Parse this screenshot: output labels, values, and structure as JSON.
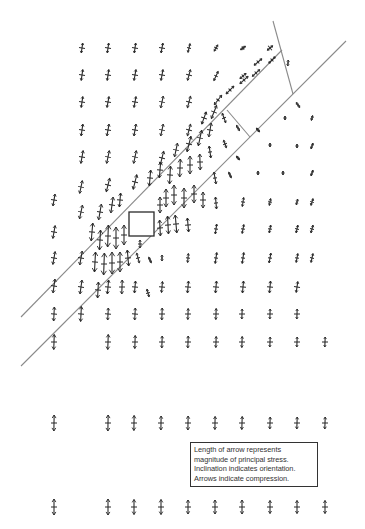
{
  "figure": {
    "type": "principal stress trajectory field",
    "background": "#ffffff",
    "ink_color": "#2a2a2a",
    "line_color": "#8a8a8a"
  },
  "legend": {
    "lines": [
      "Length of arrow represents",
      "magnitude of principal stress.",
      "Inclination indicates orientation.",
      "Arrows indicate compression."
    ]
  },
  "structure": {
    "fault_lines": [
      {
        "name": "upper-fault-line",
        "x1": 21,
        "y1": 317,
        "x2": 282,
        "y2": 50
      },
      {
        "name": "lower-fault-line",
        "x1": 21,
        "y1": 366,
        "x2": 346,
        "y2": 41
      }
    ],
    "end_lines": [
      {
        "name": "top-end-line",
        "x1": 273,
        "y1": 21,
        "x2": 293,
        "y2": 94
      },
      {
        "name": "inner-end-line",
        "x1": 227,
        "y1": 110,
        "x2": 250,
        "y2": 137
      }
    ],
    "square": {
      "x": 129,
      "y": 212,
      "w": 25,
      "h": 24
    }
  },
  "arrows": [
    {
      "x": 82,
      "y": 48,
      "len": 10,
      "ang": 8,
      "cross": 3
    },
    {
      "x": 108,
      "y": 48,
      "len": 10,
      "ang": 8,
      "cross": 3
    },
    {
      "x": 135,
      "y": 48,
      "len": 10,
      "ang": 8,
      "cross": 3
    },
    {
      "x": 162,
      "y": 48,
      "len": 10,
      "ang": 10,
      "cross": 3
    },
    {
      "x": 189,
      "y": 48,
      "len": 9,
      "ang": 14,
      "cross": 2
    },
    {
      "x": 216,
      "y": 48,
      "len": 7,
      "ang": 30,
      "cross": 2
    },
    {
      "x": 243,
      "y": 48,
      "len": 6,
      "ang": 55,
      "cross": 2
    },
    {
      "x": 270,
      "y": 48,
      "len": 7,
      "ang": 50,
      "cross": 3
    },
    {
      "x": 82,
      "y": 75,
      "len": 11,
      "ang": 8,
      "cross": 3
    },
    {
      "x": 108,
      "y": 75,
      "len": 11,
      "ang": 8,
      "cross": 3
    },
    {
      "x": 135,
      "y": 75,
      "len": 11,
      "ang": 10,
      "cross": 3
    },
    {
      "x": 162,
      "y": 75,
      "len": 11,
      "ang": 10,
      "cross": 3
    },
    {
      "x": 189,
      "y": 75,
      "len": 11,
      "ang": 15,
      "cross": 3
    },
    {
      "x": 216,
      "y": 76,
      "len": 10,
      "ang": 25,
      "cross": 2
    },
    {
      "x": 243,
      "y": 76,
      "len": 8,
      "ang": 50,
      "cross": 2
    },
    {
      "x": 258,
      "y": 62,
      "len": 10,
      "ang": 50,
      "cross": 2
    },
    {
      "x": 272,
      "y": 60,
      "len": 9,
      "ang": 45,
      "cross": 2
    },
    {
      "x": 288,
      "y": 63,
      "len": 6,
      "ang": 5,
      "cross": 1
    },
    {
      "x": 82,
      "y": 102,
      "len": 11,
      "ang": 8,
      "cross": 3
    },
    {
      "x": 108,
      "y": 102,
      "len": 11,
      "ang": 10,
      "cross": 3
    },
    {
      "x": 135,
      "y": 102,
      "len": 11,
      "ang": 10,
      "cross": 3
    },
    {
      "x": 162,
      "y": 102,
      "len": 12,
      "ang": 12,
      "cross": 3
    },
    {
      "x": 189,
      "y": 102,
      "len": 12,
      "ang": 15,
      "cross": 3
    },
    {
      "x": 230,
      "y": 90,
      "len": 11,
      "ang": 45,
      "cross": 2
    },
    {
      "x": 244,
      "y": 80,
      "len": 11,
      "ang": 48,
      "cross": 2
    },
    {
      "x": 256,
      "y": 73,
      "len": 10,
      "ang": 48,
      "cross": 2
    },
    {
      "x": 218,
      "y": 100,
      "len": 12,
      "ang": 38,
      "cross": 2
    },
    {
      "x": 298,
      "y": 105,
      "len": 6,
      "ang": -35,
      "cross": 1
    },
    {
      "x": 82,
      "y": 130,
      "len": 12,
      "ang": 8,
      "cross": 3
    },
    {
      "x": 108,
      "y": 130,
      "len": 12,
      "ang": 10,
      "cross": 3
    },
    {
      "x": 135,
      "y": 130,
      "len": 12,
      "ang": 10,
      "cross": 3
    },
    {
      "x": 162,
      "y": 130,
      "len": 12,
      "ang": 12,
      "cross": 3
    },
    {
      "x": 189,
      "y": 130,
      "len": 12,
      "ang": 15,
      "cross": 3
    },
    {
      "x": 204,
      "y": 118,
      "len": 13,
      "ang": 20,
      "cross": 3
    },
    {
      "x": 214,
      "y": 112,
      "len": 14,
      "ang": 22,
      "cross": 3
    },
    {
      "x": 224,
      "y": 118,
      "len": 10,
      "ang": -20,
      "cross": 2
    },
    {
      "x": 238,
      "y": 128,
      "len": 6,
      "ang": -30,
      "cross": 1
    },
    {
      "x": 258,
      "y": 130,
      "len": 5,
      "ang": -40,
      "cross": 1
    },
    {
      "x": 285,
      "y": 118,
      "len": 4,
      "ang": 0,
      "cross": 1
    },
    {
      "x": 312,
      "y": 118,
      "len": 5,
      "ang": 15,
      "cross": 1
    },
    {
      "x": 82,
      "y": 157,
      "len": 13,
      "ang": 10,
      "cross": 3
    },
    {
      "x": 108,
      "y": 157,
      "len": 13,
      "ang": 12,
      "cross": 3
    },
    {
      "x": 135,
      "y": 157,
      "len": 13,
      "ang": 12,
      "cross": 3
    },
    {
      "x": 162,
      "y": 158,
      "len": 14,
      "ang": 14,
      "cross": 3
    },
    {
      "x": 176,
      "y": 150,
      "len": 14,
      "ang": 12,
      "cross": 3
    },
    {
      "x": 189,
      "y": 144,
      "len": 16,
      "ang": 14,
      "cross": 3
    },
    {
      "x": 200,
      "y": 138,
      "len": 16,
      "ang": 12,
      "cross": 3
    },
    {
      "x": 210,
      "y": 130,
      "len": 14,
      "ang": 10,
      "cross": 3
    },
    {
      "x": 210,
      "y": 152,
      "len": 12,
      "ang": -8,
      "cross": 2
    },
    {
      "x": 225,
      "y": 144,
      "len": 8,
      "ang": -20,
      "cross": 2
    },
    {
      "x": 238,
      "y": 158,
      "len": 5,
      "ang": -40,
      "cross": 1
    },
    {
      "x": 270,
      "y": 145,
      "len": 4,
      "ang": 0,
      "cross": 1
    },
    {
      "x": 297,
      "y": 146,
      "len": 4,
      "ang": 0,
      "cross": 1
    },
    {
      "x": 312,
      "y": 146,
      "len": 6,
      "ang": 20,
      "cross": 1
    },
    {
      "x": 54,
      "y": 200,
      "len": 12,
      "ang": 10,
      "cross": 3
    },
    {
      "x": 81,
      "y": 187,
      "len": 13,
      "ang": 12,
      "cross": 3
    },
    {
      "x": 108,
      "y": 185,
      "len": 14,
      "ang": 14,
      "cross": 3
    },
    {
      "x": 135,
      "y": 182,
      "len": 15,
      "ang": 14,
      "cross": 3
    },
    {
      "x": 150,
      "y": 178,
      "len": 16,
      "ang": 5,
      "cross": 3
    },
    {
      "x": 160,
      "y": 170,
      "len": 16,
      "ang": 5,
      "cross": 3
    },
    {
      "x": 170,
      "y": 175,
      "len": 18,
      "ang": 3,
      "cross": 3
    },
    {
      "x": 180,
      "y": 168,
      "len": 18,
      "ang": 2,
      "cross": 3
    },
    {
      "x": 190,
      "y": 165,
      "len": 18,
      "ang": 0,
      "cross": 3
    },
    {
      "x": 200,
      "y": 162,
      "len": 16,
      "ang": -2,
      "cross": 3
    },
    {
      "x": 215,
      "y": 178,
      "len": 12,
      "ang": -10,
      "cross": 2
    },
    {
      "x": 230,
      "y": 175,
      "len": 6,
      "ang": -25,
      "cross": 1
    },
    {
      "x": 258,
      "y": 173,
      "len": 4,
      "ang": 0,
      "cross": 1
    },
    {
      "x": 283,
      "y": 173,
      "len": 4,
      "ang": 0,
      "cross": 1
    },
    {
      "x": 312,
      "y": 173,
      "len": 6,
      "ang": 20,
      "cross": 1
    },
    {
      "x": 54,
      "y": 232,
      "len": 13,
      "ang": 10,
      "cross": 3
    },
    {
      "x": 81,
      "y": 212,
      "len": 14,
      "ang": 12,
      "cross": 3
    },
    {
      "x": 100,
      "y": 212,
      "len": 16,
      "ang": 10,
      "cross": 3
    },
    {
      "x": 112,
      "y": 205,
      "len": 16,
      "ang": 8,
      "cross": 3
    },
    {
      "x": 120,
      "y": 200,
      "len": 14,
      "ang": 5,
      "cross": 3
    },
    {
      "x": 160,
      "y": 205,
      "len": 16,
      "ang": 0,
      "cross": 3
    },
    {
      "x": 166,
      "y": 198,
      "len": 18,
      "ang": 0,
      "cross": 3
    },
    {
      "x": 174,
      "y": 195,
      "len": 20,
      "ang": 0,
      "cross": 3
    },
    {
      "x": 184,
      "y": 198,
      "len": 20,
      "ang": 0,
      "cross": 3
    },
    {
      "x": 194,
      "y": 194,
      "len": 18,
      "ang": 0,
      "cross": 3
    },
    {
      "x": 203,
      "y": 200,
      "len": 16,
      "ang": 0,
      "cross": 3
    },
    {
      "x": 216,
      "y": 203,
      "len": 12,
      "ang": -5,
      "cross": 2
    },
    {
      "x": 243,
      "y": 202,
      "len": 9,
      "ang": 8,
      "cross": 2
    },
    {
      "x": 270,
      "y": 202,
      "len": 7,
      "ang": 10,
      "cross": 2
    },
    {
      "x": 297,
      "y": 202,
      "len": 6,
      "ang": 12,
      "cross": 1
    },
    {
      "x": 312,
      "y": 202,
      "len": 7,
      "ang": 18,
      "cross": 2
    },
    {
      "x": 92,
      "y": 232,
      "len": 18,
      "ang": 5,
      "cross": 3
    },
    {
      "x": 100,
      "y": 240,
      "len": 20,
      "ang": 3,
      "cross": 3
    },
    {
      "x": 108,
      "y": 236,
      "len": 22,
      "ang": 2,
      "cross": 3
    },
    {
      "x": 116,
      "y": 238,
      "len": 22,
      "ang": 0,
      "cross": 3
    },
    {
      "x": 124,
      "y": 235,
      "len": 20,
      "ang": 0,
      "cross": 3
    },
    {
      "x": 140,
      "y": 244,
      "len": 8,
      "ang": 0,
      "cross": 2
    },
    {
      "x": 160,
      "y": 228,
      "len": 16,
      "ang": -3,
      "cross": 3
    },
    {
      "x": 168,
      "y": 225,
      "len": 18,
      "ang": -3,
      "cross": 3
    },
    {
      "x": 176,
      "y": 224,
      "len": 18,
      "ang": -5,
      "cross": 3
    },
    {
      "x": 188,
      "y": 225,
      "len": 14,
      "ang": -5,
      "cross": 3
    },
    {
      "x": 216,
      "y": 229,
      "len": 10,
      "ang": 8,
      "cross": 2
    },
    {
      "x": 243,
      "y": 229,
      "len": 9,
      "ang": 10,
      "cross": 2
    },
    {
      "x": 270,
      "y": 229,
      "len": 8,
      "ang": 10,
      "cross": 2
    },
    {
      "x": 297,
      "y": 229,
      "len": 8,
      "ang": 12,
      "cross": 2
    },
    {
      "x": 312,
      "y": 229,
      "len": 8,
      "ang": 15,
      "cross": 2
    },
    {
      "x": 54,
      "y": 258,
      "len": 13,
      "ang": 10,
      "cross": 3
    },
    {
      "x": 81,
      "y": 258,
      "len": 14,
      "ang": 10,
      "cross": 3
    },
    {
      "x": 95,
      "y": 262,
      "len": 20,
      "ang": 3,
      "cross": 3
    },
    {
      "x": 104,
      "y": 264,
      "len": 22,
      "ang": 2,
      "cross": 3
    },
    {
      "x": 112,
      "y": 263,
      "len": 22,
      "ang": 0,
      "cross": 3
    },
    {
      "x": 120,
      "y": 262,
      "len": 20,
      "ang": 0,
      "cross": 3
    },
    {
      "x": 128,
      "y": 258,
      "len": 16,
      "ang": -5,
      "cross": 3
    },
    {
      "x": 138,
      "y": 258,
      "len": 10,
      "ang": -15,
      "cross": 2
    },
    {
      "x": 150,
      "y": 260,
      "len": 6,
      "ang": -25,
      "cross": 1
    },
    {
      "x": 162,
      "y": 258,
      "len": 6,
      "ang": 0,
      "cross": 1
    },
    {
      "x": 188,
      "y": 258,
      "len": 9,
      "ang": 5,
      "cross": 2
    },
    {
      "x": 216,
      "y": 258,
      "len": 11,
      "ang": 8,
      "cross": 2
    },
    {
      "x": 243,
      "y": 258,
      "len": 11,
      "ang": 8,
      "cross": 2
    },
    {
      "x": 270,
      "y": 258,
      "len": 10,
      "ang": 10,
      "cross": 2
    },
    {
      "x": 297,
      "y": 258,
      "len": 9,
      "ang": 10,
      "cross": 2
    },
    {
      "x": 312,
      "y": 258,
      "len": 9,
      "ang": 12,
      "cross": 2
    },
    {
      "x": 54,
      "y": 286,
      "len": 14,
      "ang": 8,
      "cross": 3
    },
    {
      "x": 81,
      "y": 287,
      "len": 14,
      "ang": 8,
      "cross": 3
    },
    {
      "x": 98,
      "y": 290,
      "len": 16,
      "ang": 3,
      "cross": 3
    },
    {
      "x": 108,
      "y": 287,
      "len": 14,
      "ang": 5,
      "cross": 3
    },
    {
      "x": 122,
      "y": 287,
      "len": 14,
      "ang": 2,
      "cross": 3
    },
    {
      "x": 135,
      "y": 287,
      "len": 12,
      "ang": 5,
      "cross": 3
    },
    {
      "x": 148,
      "y": 293,
      "len": 8,
      "ang": -15,
      "cross": 2
    },
    {
      "x": 162,
      "y": 287,
      "len": 11,
      "ang": 5,
      "cross": 3
    },
    {
      "x": 188,
      "y": 287,
      "len": 12,
      "ang": 5,
      "cross": 3
    },
    {
      "x": 216,
      "y": 287,
      "len": 12,
      "ang": 5,
      "cross": 3
    },
    {
      "x": 243,
      "y": 287,
      "len": 12,
      "ang": 5,
      "cross": 3
    },
    {
      "x": 270,
      "y": 287,
      "len": 12,
      "ang": 5,
      "cross": 3
    },
    {
      "x": 297,
      "y": 287,
      "len": 11,
      "ang": 8,
      "cross": 3
    },
    {
      "x": 54,
      "y": 314,
      "len": 14,
      "ang": 3,
      "cross": 3
    },
    {
      "x": 81,
      "y": 314,
      "len": 15,
      "ang": 3,
      "cross": 3
    },
    {
      "x": 108,
      "y": 314,
      "len": 12,
      "ang": 3,
      "cross": 3
    },
    {
      "x": 135,
      "y": 314,
      "len": 12,
      "ang": 3,
      "cross": 3
    },
    {
      "x": 162,
      "y": 314,
      "len": 12,
      "ang": 2,
      "cross": 3
    },
    {
      "x": 188,
      "y": 314,
      "len": 11,
      "ang": 2,
      "cross": 3
    },
    {
      "x": 216,
      "y": 314,
      "len": 11,
      "ang": 2,
      "cross": 3
    },
    {
      "x": 242,
      "y": 314,
      "len": 10,
      "ang": 2,
      "cross": 3
    },
    {
      "x": 270,
      "y": 314,
      "len": 10,
      "ang": 2,
      "cross": 3
    },
    {
      "x": 297,
      "y": 314,
      "len": 10,
      "ang": 2,
      "cross": 3
    },
    {
      "x": 54,
      "y": 342,
      "len": 15,
      "ang": 2,
      "cross": 3
    },
    {
      "x": 108,
      "y": 342,
      "len": 15,
      "ang": 2,
      "cross": 3
    },
    {
      "x": 135,
      "y": 342,
      "len": 13,
      "ang": 2,
      "cross": 3
    },
    {
      "x": 162,
      "y": 342,
      "len": 12,
      "ang": 2,
      "cross": 3
    },
    {
      "x": 188,
      "y": 342,
      "len": 12,
      "ang": 2,
      "cross": 3
    },
    {
      "x": 216,
      "y": 342,
      "len": 11,
      "ang": 2,
      "cross": 3
    },
    {
      "x": 242,
      "y": 342,
      "len": 11,
      "ang": 2,
      "cross": 3
    },
    {
      "x": 270,
      "y": 342,
      "len": 10,
      "ang": 2,
      "cross": 3
    },
    {
      "x": 297,
      "y": 342,
      "len": 10,
      "ang": 2,
      "cross": 3
    },
    {
      "x": 325,
      "y": 342,
      "len": 10,
      "ang": 2,
      "cross": 3
    },
    {
      "x": 54,
      "y": 423,
      "len": 16,
      "ang": 1,
      "cross": 3
    },
    {
      "x": 108,
      "y": 423,
      "len": 16,
      "ang": 1,
      "cross": 3
    },
    {
      "x": 134,
      "y": 423,
      "len": 15,
      "ang": 1,
      "cross": 3
    },
    {
      "x": 161,
      "y": 423,
      "len": 14,
      "ang": 1,
      "cross": 3
    },
    {
      "x": 188,
      "y": 423,
      "len": 14,
      "ang": 1,
      "cross": 3
    },
    {
      "x": 215,
      "y": 423,
      "len": 13,
      "ang": 1,
      "cross": 3
    },
    {
      "x": 242,
      "y": 423,
      "len": 13,
      "ang": 2,
      "cross": 3
    },
    {
      "x": 270,
      "y": 423,
      "len": 12,
      "ang": 2,
      "cross": 3
    },
    {
      "x": 297,
      "y": 423,
      "len": 12,
      "ang": 2,
      "cross": 3
    },
    {
      "x": 325,
      "y": 423,
      "len": 12,
      "ang": 2,
      "cross": 3
    },
    {
      "x": 54,
      "y": 507,
      "len": 16,
      "ang": 0,
      "cross": 3
    },
    {
      "x": 108,
      "y": 507,
      "len": 16,
      "ang": 0,
      "cross": 3
    },
    {
      "x": 134,
      "y": 507,
      "len": 15,
      "ang": 0,
      "cross": 3
    },
    {
      "x": 161,
      "y": 507,
      "len": 15,
      "ang": 0,
      "cross": 3
    },
    {
      "x": 188,
      "y": 507,
      "len": 14,
      "ang": 0,
      "cross": 3
    },
    {
      "x": 215,
      "y": 507,
      "len": 14,
      "ang": 0,
      "cross": 3
    },
    {
      "x": 242,
      "y": 507,
      "len": 14,
      "ang": 0,
      "cross": 3
    },
    {
      "x": 270,
      "y": 507,
      "len": 13,
      "ang": 0,
      "cross": 3
    },
    {
      "x": 297,
      "y": 507,
      "len": 13,
      "ang": 0,
      "cross": 3
    },
    {
      "x": 325,
      "y": 507,
      "len": 13,
      "ang": 0,
      "cross": 3
    }
  ]
}
